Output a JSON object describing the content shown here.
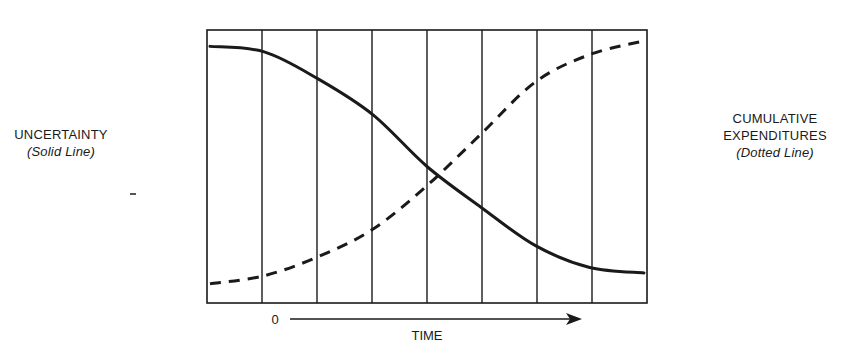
{
  "left_label": {
    "title": "UNCERTAINTY",
    "subtitle": "(Solid Line)"
  },
  "right_label": {
    "title_line1": "CUMULATIVE",
    "title_line2": "EXPENDITURES",
    "subtitle": "(Dotted Line)"
  },
  "x_axis": {
    "origin_label": "0",
    "label": "TIME"
  },
  "colors": {
    "ink": "#1a1a1a",
    "background": "#ffffff"
  },
  "chart_data": {
    "type": "line",
    "title": "",
    "xlabel": "TIME",
    "ylabel_left": "UNCERTAINTY (Solid Line)",
    "ylabel_right": "CUMULATIVE EXPENDITURES (Dotted Line)",
    "x_origin_label": "0",
    "grid": {
      "vertical_divisions": 8,
      "horizontal": false
    },
    "x": [
      0,
      1,
      2,
      3,
      4,
      5,
      6,
      7,
      8
    ],
    "ylim": [
      0,
      100
    ],
    "series": [
      {
        "name": "Uncertainty",
        "style": "solid",
        "values": [
          94,
          92,
          82,
          69,
          50,
          35,
          21,
          13,
          11
        ]
      },
      {
        "name": "Cumulative Expenditures",
        "style": "dashed",
        "values": [
          7,
          10,
          17,
          27,
          43,
          62,
          81,
          91,
          96
        ]
      }
    ]
  }
}
